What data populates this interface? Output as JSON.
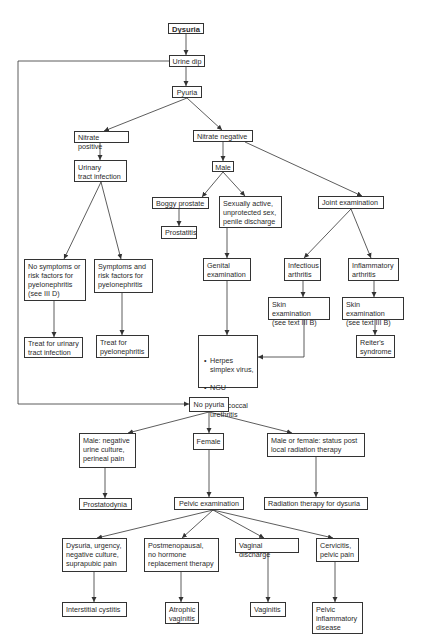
{
  "diagram": {
    "type": "flowchart",
    "title": "Dysuria",
    "nodes": {
      "dysuria": "Dysuria",
      "urine_dip": "Urine dip",
      "pyuria": "Pyuria",
      "nitrate_positive": "Nitrate positive",
      "uti": "Urinary\ntract infection",
      "no_symptoms": "No symptoms or\nrisk factors for\npyelonephritis\n(see III D)",
      "symptoms": "Symptoms and\nrisk factors for\npyelonephritis",
      "treat_uti": "Treat for urinary\ntract infection",
      "treat_pyelo": "Treat for\npyelonephritis",
      "nitrate_negative": "Nitrate negative",
      "male": "Male",
      "boggy_prostate": "Boggy prostate",
      "prostatitis": "Prostatitis",
      "sexually_active": "Sexually active,\nunprotected sex,\npenile discharge",
      "genital_exam": "Genital\nexamination",
      "joint_exam": "Joint examination",
      "infectious_arthritis": "Infectious\narthritis",
      "inflammatory_arthritis": "Inflammatory\narthritis",
      "skin_exam_1": "Skin examination\n(see text III B)",
      "skin_exam_2": "Skin examination\n(see text III B)",
      "reiters": "Reiter's\nsyndrome",
      "diagnoses_list": [
        "Herpes\nsimplex virus,",
        "NGU",
        "Gonococcal\nurethritis"
      ],
      "no_pyuria": "No pyuria",
      "male_negative": "Male:  negative\nurine culture,\nperineal pain",
      "female": "Female",
      "male_or_female": "Male or female:  status post\nlocal radiation therapy",
      "prostatodynia": "Prostatodynia",
      "pelvic_exam": "Pelvic examination",
      "radiation_therapy": "Radiation therapy for dysuria",
      "dysuria_urgency": "Dysuria, urgency,\nnegative culture,\nsuprapubic pain",
      "postmenopausal": "Postmenopausal,\nno hormone\nreplacement therapy",
      "vaginal_discharge": "Vaginal discharge",
      "cervicitis": "Cervicitis,\npelvic pain",
      "interstitial_cystitis": "Interstitial cystitis",
      "atrophic_vaginitis": "Atrophic\nvaginitis",
      "vaginitis": "Vaginitis",
      "pid": "Pelvic\ninflammatory\ndisease"
    },
    "edges": [
      [
        "dysuria",
        "urine_dip"
      ],
      [
        "urine_dip",
        "pyuria"
      ],
      [
        "urine_dip",
        "no_pyuria"
      ],
      [
        "pyuria",
        "nitrate_positive"
      ],
      [
        "pyuria",
        "nitrate_negative"
      ],
      [
        "nitrate_positive",
        "uti"
      ],
      [
        "uti",
        "no_symptoms"
      ],
      [
        "uti",
        "symptoms"
      ],
      [
        "no_symptoms",
        "treat_uti"
      ],
      [
        "symptoms",
        "treat_pyelo"
      ],
      [
        "nitrate_negative",
        "male"
      ],
      [
        "nitrate_negative",
        "joint_exam"
      ],
      [
        "male",
        "boggy_prostate"
      ],
      [
        "male",
        "sexually_active"
      ],
      [
        "boggy_prostate",
        "prostatitis"
      ],
      [
        "sexually_active",
        "genital_exam"
      ],
      [
        "genital_exam",
        "diagnoses_list"
      ],
      [
        "joint_exam",
        "infectious_arthritis"
      ],
      [
        "joint_exam",
        "inflammatory_arthritis"
      ],
      [
        "infectious_arthritis",
        "skin_exam_1"
      ],
      [
        "inflammatory_arthritis",
        "skin_exam_2"
      ],
      [
        "skin_exam_1",
        "diagnoses_list"
      ],
      [
        "skin_exam_2",
        "reiters"
      ],
      [
        "no_pyuria",
        "male_negative"
      ],
      [
        "no_pyuria",
        "female"
      ],
      [
        "no_pyuria",
        "male_or_female"
      ],
      [
        "male_negative",
        "prostatodynia"
      ],
      [
        "female",
        "pelvic_exam"
      ],
      [
        "male_or_female",
        "radiation_therapy"
      ],
      [
        "pelvic_exam",
        "dysuria_urgency"
      ],
      [
        "pelvic_exam",
        "postmenopausal"
      ],
      [
        "pelvic_exam",
        "vaginal_discharge"
      ],
      [
        "pelvic_exam",
        "cervicitis"
      ],
      [
        "dysuria_urgency",
        "interstitial_cystitis"
      ],
      [
        "postmenopausal",
        "atrophic_vaginitis"
      ],
      [
        "vaginal_discharge",
        "vaginitis"
      ],
      [
        "cervicitis",
        "pid"
      ]
    ]
  },
  "style": {
    "line_color": "#333333",
    "box_border": "#333333",
    "background": "#ffffff"
  }
}
